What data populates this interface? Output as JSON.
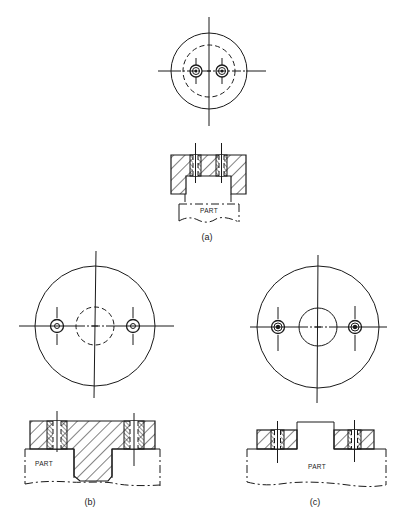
{
  "figure": {
    "panels": [
      {
        "id": "a",
        "label": "(a)",
        "part_label": "PART",
        "top_view": {
          "outer_circle": "solid",
          "inner_circle": "dashed",
          "holes": 2,
          "hole_style": "bushing-with-center"
        },
        "section_view": {
          "type": "fixture-over-part",
          "part_position": "below"
        }
      },
      {
        "id": "b",
        "label": "(b)",
        "part_label": "PART",
        "top_view": {
          "outer_circle": "solid",
          "inner_circle": "dashed",
          "holes": 2,
          "hole_style": "bushing-with-center"
        },
        "section_view": {
          "type": "fixture-with-center-plug",
          "part_position": "below-sides"
        }
      },
      {
        "id": "c",
        "label": "(c)",
        "part_label": "PART",
        "top_view": {
          "outer_circle": "solid",
          "inner_circle": "solid",
          "holes": 2,
          "hole_style": "bushing-with-dot"
        },
        "section_view": {
          "type": "part-boss-with-ring-fixtures",
          "part_position": "below"
        }
      }
    ]
  },
  "colors": {
    "background": "#ffffff",
    "line": "#1a1a1a"
  }
}
